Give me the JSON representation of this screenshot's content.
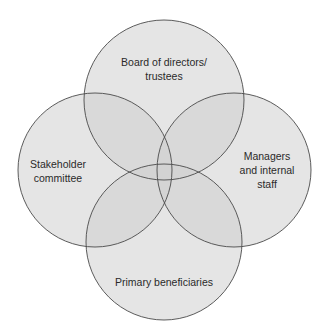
{
  "diagram": {
    "type": "venn",
    "colors": {
      "background": "#ffffff",
      "circle_fill": "#d8d8d8",
      "circle_stroke": "#555555",
      "overlap_tint": "#a9a9a9"
    },
    "circles": [
      {
        "id": "top",
        "label_lines": [
          "Board of directors/",
          "trustees"
        ],
        "cx": 164,
        "cy": 100,
        "r": 80
      },
      {
        "id": "left",
        "label_lines": [
          "Stakeholder",
          "committee"
        ],
        "cx": 95,
        "cy": 170,
        "r": 77
      },
      {
        "id": "right",
        "label_lines": [
          "Managers",
          "and internal",
          "staff"
        ],
        "cx": 234,
        "cy": 170,
        "r": 77
      },
      {
        "id": "bottom",
        "label_lines": [
          "Primary beneficiaries"
        ],
        "cx": 164,
        "cy": 242,
        "r": 78
      }
    ]
  }
}
